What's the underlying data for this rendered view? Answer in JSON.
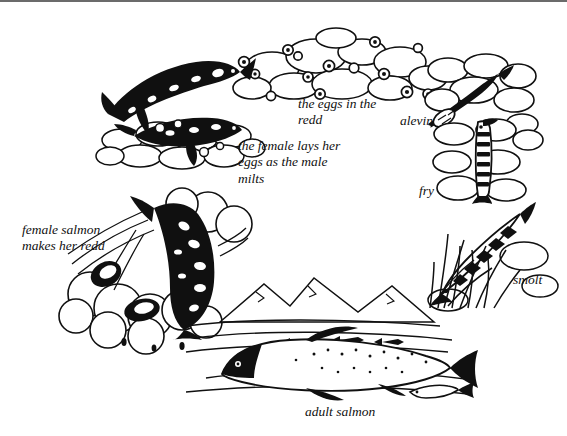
{
  "figure": {
    "style": "pen-and-ink line illustration",
    "background_color": "#ffffff",
    "ink_color": "#101010",
    "rule_color": "#6b6b6b",
    "width": 567,
    "height": 436
  },
  "labels": [
    {
      "id": "eggs-in-the-redd",
      "text": "the eggs in the\nredd",
      "x": 298,
      "y": 96,
      "size": 13.5,
      "align": "left"
    },
    {
      "id": "alevin",
      "text": "alevin",
      "x": 400,
      "y": 113,
      "size": 13.5,
      "align": "left"
    },
    {
      "id": "female-lays-eggs",
      "text": "the female lays her\neggs as the male\nmilts",
      "x": 238,
      "y": 138,
      "size": 13.5,
      "align": "left"
    },
    {
      "id": "fry",
      "text": "fry",
      "x": 419,
      "y": 183,
      "size": 13.5,
      "align": "left"
    },
    {
      "id": "female-makes-redd",
      "text": "female salmon\nmakes her redd",
      "x": 22,
      "y": 222,
      "size": 13.5,
      "align": "left"
    },
    {
      "id": "smolt",
      "text": "smolt",
      "x": 513,
      "y": 272,
      "size": 13.5,
      "align": "left"
    },
    {
      "id": "adult-salmon",
      "text": "adult salmon",
      "x": 305,
      "y": 404,
      "size": 13.5,
      "align": "left"
    }
  ],
  "stages": [
    {
      "id": "spawning-pair",
      "label": "the female lays her eggs as the male milts"
    },
    {
      "id": "eggs",
      "label": "the eggs in the redd"
    },
    {
      "id": "alevin",
      "label": "alevin"
    },
    {
      "id": "fry",
      "label": "fry"
    },
    {
      "id": "smolt",
      "label": "smolt"
    },
    {
      "id": "adult",
      "label": "adult salmon"
    },
    {
      "id": "returning-female",
      "label": "female salmon makes her redd"
    }
  ]
}
